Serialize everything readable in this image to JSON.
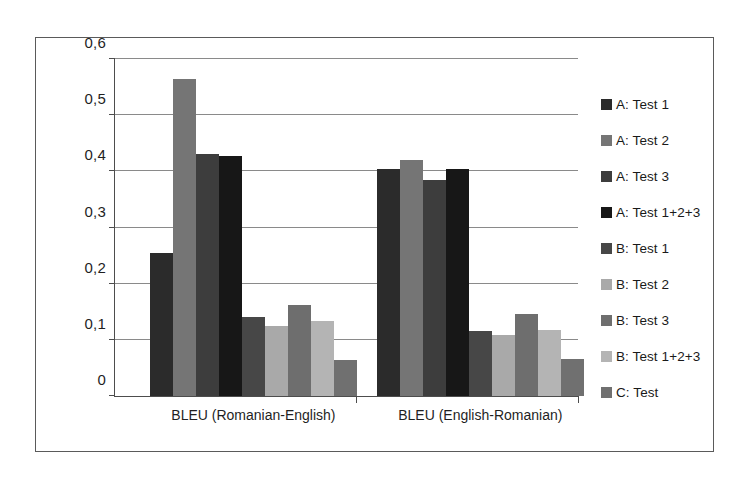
{
  "chart_data": {
    "type": "bar",
    "title": "",
    "subtitle": "",
    "xlabel": "",
    "ylabel": "",
    "categories": [
      "BLEU (Romanian-English)",
      "BLEU (English-Romanian)"
    ],
    "ylim": [
      0,
      0.6
    ],
    "yticks": [
      0,
      0.1,
      0.2,
      0.3,
      0.4,
      0.5,
      0.6
    ],
    "ytick_labels": [
      "0",
      "0,1",
      "0,2",
      "0,3",
      "0,4",
      "0,5",
      "0,6"
    ],
    "decimal_separator": ",",
    "grid": "horizontal",
    "legend_position": "right",
    "series": [
      {
        "name": "A: Test 1",
        "color": "#2b2b2b",
        "values": [
          0.255,
          0.405
        ]
      },
      {
        "name": "A: Test 2",
        "color": "#757575",
        "values": [
          0.565,
          0.42
        ]
      },
      {
        "name": "A: Test 3",
        "color": "#3d3d3d",
        "values": [
          0.43,
          0.385
        ]
      },
      {
        "name": "A: Test 1+2+3",
        "color": "#171717",
        "values": [
          0.428,
          0.405
        ]
      },
      {
        "name": "B: Test 1",
        "color": "#474747",
        "values": [
          0.14,
          0.116
        ]
      },
      {
        "name": "B: Test 2",
        "color": "#a9a9a9",
        "values": [
          0.125,
          0.108
        ]
      },
      {
        "name": "B: Test 3",
        "color": "#6e6e6e",
        "values": [
          0.162,
          0.146
        ]
      },
      {
        "name": "B: Test 1+2+3",
        "color": "#b4b4b4",
        "values": [
          0.134,
          0.117
        ]
      },
      {
        "name": "C: Test",
        "color": "#707070",
        "values": [
          0.065,
          0.066
        ]
      }
    ]
  },
  "legend": {
    "items": [
      {
        "label": "A: Test 1"
      },
      {
        "label": "A: Test 2"
      },
      {
        "label": "A: Test 3"
      },
      {
        "label": "A: Test 1+2+3"
      },
      {
        "label": "B: Test 1"
      },
      {
        "label": "B: Test 2"
      },
      {
        "label": "B: Test 3"
      },
      {
        "label": "B: Test 1+2+3"
      },
      {
        "label": "C: Test"
      }
    ]
  },
  "colors": {
    "background": "#ffffff",
    "frame": "#5a5a5a",
    "axis": "#4d4d4d",
    "gridline": "#8a8a8a",
    "text": "#1f1f1f"
  }
}
